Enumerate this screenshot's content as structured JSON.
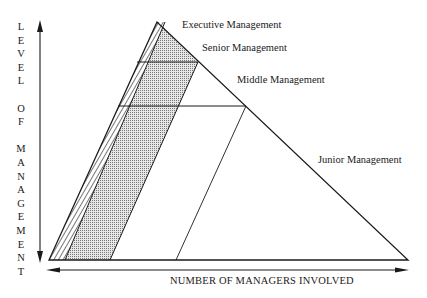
{
  "diagram": {
    "levels": [
      {
        "name": "Executive Management"
      },
      {
        "name": "Senior Management"
      },
      {
        "name": "Middle Management"
      },
      {
        "name": "Junior Management"
      }
    ],
    "y_axis_label": "LEVEL OF MANAGEMENT",
    "y_axis_letters": [
      "L",
      "E",
      "V",
      "E",
      "L",
      "",
      "O",
      "F",
      "",
      "M",
      "A",
      "N",
      "A",
      "G",
      "E",
      "M",
      "E",
      "N",
      "T"
    ],
    "x_axis_label": "NUMBER OF MANAGERS INVOLVED",
    "colors": {
      "line": "#1a1a1a",
      "dot_fill": "#bdbdbd",
      "background": "#ffffff"
    }
  }
}
